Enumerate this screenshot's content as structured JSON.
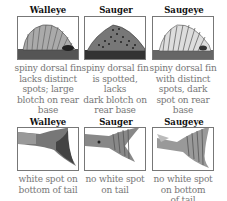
{
  "row1": {
    "panels": [
      {
        "title": "Walleye",
        "caption_lines": [
          "spiny dorsal fin",
          "lacks distinct",
          "spots; large",
          "blotch on rear",
          "base"
        ],
        "image": "walleye-dorsal-fin"
      },
      {
        "title": "Sauger",
        "caption_lines": [
          "spiny dorsal fin",
          "is spotted, lacks",
          "dark blotch on",
          "rear base"
        ],
        "image": "sauger-dorsal-fin"
      },
      {
        "title": "Saugeye",
        "caption_lines": [
          "spiny dorsal fin",
          "with distinct",
          "spots, dark",
          "spot on rear",
          "base"
        ],
        "image": "saugeye-dorsal-fin"
      }
    ]
  },
  "row2": {
    "panels": [
      {
        "title": "Walleye",
        "caption_lines": [
          "white spot on",
          "bottom of tail"
        ],
        "image": "walleye-tail"
      },
      {
        "title": "Sauger",
        "caption_lines": [
          "no white spot",
          "on tail"
        ],
        "image": "sauger-tail"
      },
      {
        "title": "Saugeye",
        "caption_lines": [
          "no white spot",
          "on bottom",
          "of tail"
        ],
        "image": "saugeye-tail"
      }
    ]
  }
}
